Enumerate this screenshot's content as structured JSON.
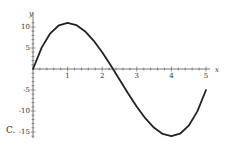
{
  "choice_label": "C.",
  "chart_data": {
    "type": "line",
    "title": "",
    "xlabel": "x",
    "ylabel": "y",
    "xlim": [
      0,
      5
    ],
    "ylim": [
      -16.5,
      12
    ],
    "x_ticks": [
      "1",
      "2",
      "3",
      "4",
      "5"
    ],
    "y_ticks": [
      "10",
      "5",
      "-5",
      "-10",
      "-15"
    ],
    "grid": false,
    "legend": null,
    "series": [
      {
        "name": "y = 2x^3 - 15x^2 + 24x",
        "x": [
          0,
          0.25,
          0.5,
          0.75,
          1,
          1.25,
          1.5,
          1.75,
          2,
          2.25,
          2.5,
          2.75,
          3,
          3.25,
          3.5,
          3.75,
          4,
          4.25,
          4.5,
          4.75,
          5
        ],
        "values": [
          0,
          5.09,
          8.5,
          10.41,
          11,
          10.47,
          9,
          6.78,
          4,
          0.84,
          -2.5,
          -5.84,
          -9,
          -11.78,
          -14,
          -15.47,
          -16,
          -15.41,
          -13.5,
          -10.09,
          -5
        ]
      }
    ],
    "annotations": []
  }
}
